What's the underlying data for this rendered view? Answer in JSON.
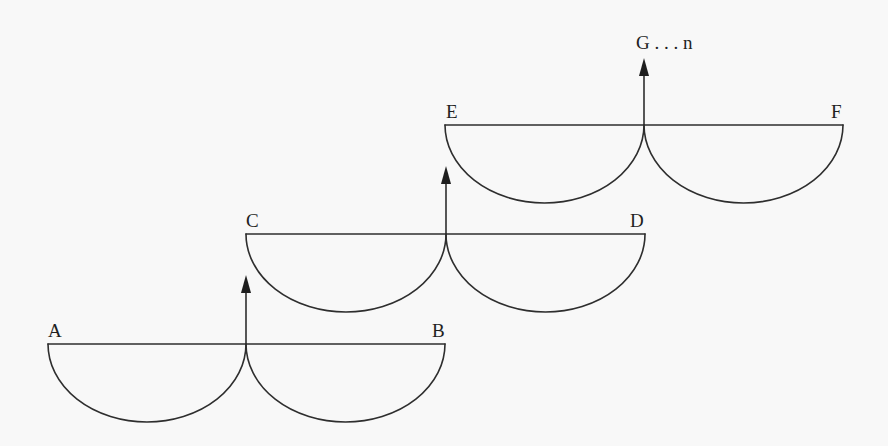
{
  "diagram": {
    "stroke_color": "#2e2e2e",
    "background_color": "#f8f8f8",
    "units": [
      {
        "id": "unit-ab",
        "left_label": "A",
        "right_label": "B",
        "line_y": 344,
        "x_left": 48,
        "x_junction": 246,
        "x_right": 445,
        "arc_depth": 78,
        "arrow_tip_y": 275
      },
      {
        "id": "unit-cd",
        "left_label": "C",
        "right_label": "D",
        "line_y": 234,
        "x_left": 246,
        "x_junction": 446,
        "x_right": 645,
        "arc_depth": 78,
        "arrow_tip_y": 166
      },
      {
        "id": "unit-ef",
        "left_label": "E",
        "right_label": "F",
        "line_y": 125,
        "x_left": 445,
        "x_junction": 644,
        "x_right": 843,
        "arc_depth": 78,
        "arrow_tip_y": 58
      }
    ],
    "top_label": "G . . . n"
  }
}
